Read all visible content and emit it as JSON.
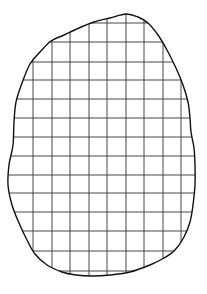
{
  "diagram": {
    "type": "irregular-shape-on-grid",
    "colors": {
      "background": "#ffffff",
      "outline": "#111111",
      "grid": "#333333"
    },
    "grid": {
      "cell_size_px": 18.6,
      "vertical_lines_x": [
        33,
        52,
        70,
        89,
        107,
        126,
        144,
        163,
        181
      ],
      "horizontal_lines_y": [
        23,
        42,
        62,
        80,
        99,
        118,
        137,
        156,
        175,
        193,
        212,
        231,
        251,
        271
      ]
    },
    "outline_points": [
      [
        126,
        14
      ],
      [
        138,
        17
      ],
      [
        148,
        23
      ],
      [
        158,
        35
      ],
      [
        167,
        50
      ],
      [
        176,
        68
      ],
      [
        183,
        85
      ],
      [
        188,
        102
      ],
      [
        190,
        118
      ],
      [
        191,
        132
      ],
      [
        194,
        148
      ],
      [
        195,
        165
      ],
      [
        195,
        185
      ],
      [
        193,
        205
      ],
      [
        190,
        222
      ],
      [
        184,
        237
      ],
      [
        175,
        250
      ],
      [
        164,
        258
      ],
      [
        150,
        265
      ],
      [
        130,
        272
      ],
      [
        110,
        275
      ],
      [
        92,
        276
      ],
      [
        76,
        275
      ],
      [
        62,
        272
      ],
      [
        47,
        265
      ],
      [
        35,
        254
      ],
      [
        27,
        240
      ],
      [
        19,
        223
      ],
      [
        12,
        205
      ],
      [
        8,
        185
      ],
      [
        9,
        165
      ],
      [
        13,
        145
      ],
      [
        14,
        122
      ],
      [
        16,
        102
      ],
      [
        22,
        83
      ],
      [
        30,
        64
      ],
      [
        40,
        52
      ],
      [
        51,
        41
      ],
      [
        64,
        35
      ],
      [
        79,
        28
      ],
      [
        94,
        22
      ],
      [
        110,
        18
      ]
    ]
  }
}
